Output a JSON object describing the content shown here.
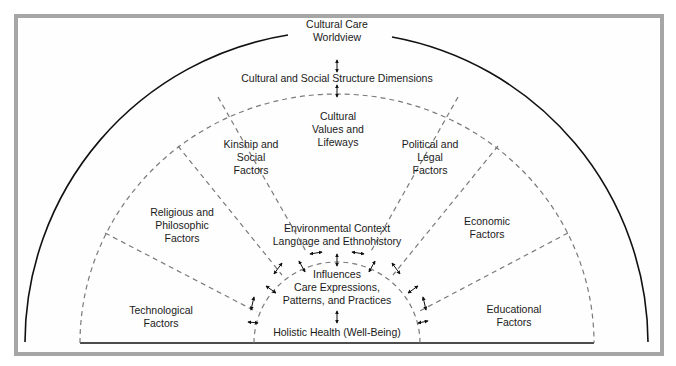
{
  "diagram": {
    "title": "Cultural Care\nWorldview",
    "dimensions": "Cultural and Social Structure Dimensions",
    "factors": [
      {
        "label": "Technological\nFactors"
      },
      {
        "label": "Religious and\nPhilosophic\nFactors"
      },
      {
        "label": "Kinship and\nSocial\nFactors"
      },
      {
        "label": "Cultural\nValues and\nLifeways"
      },
      {
        "label": "Political and\nLegal\nFactors"
      },
      {
        "label": "Economic\nFactors"
      },
      {
        "label": "Educational\nFactors"
      }
    ],
    "environment": "Environmental Context\nLanguage and Ethnohistory",
    "influences": "Influences\nCare Expressions,\nPatterns, and Practices",
    "health": "Holistic Health (Well-Being)"
  },
  "colors": {
    "frame": "#a6a6a6",
    "solid_line": "#111111",
    "dashed_line": "#7a7a7a",
    "text": "#1a1a1a"
  }
}
